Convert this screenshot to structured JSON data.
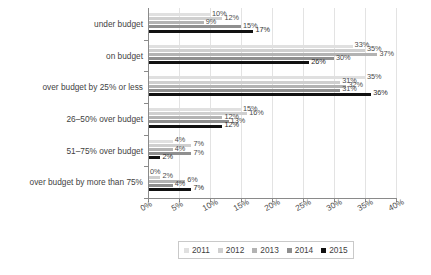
{
  "chart_data": {
    "type": "bar",
    "orientation": "horizontal",
    "title": "",
    "subtitle": "",
    "xlabel": "",
    "ylabel": "",
    "xlim": [
      0,
      40
    ],
    "grid": true,
    "legend_position": "bottom",
    "value_suffix": "%",
    "categories": [
      "under budget",
      "on budget",
      "over budget by 25% or less",
      "26–50% over budget",
      "51–75% over budget",
      "over budget by more than 75%"
    ],
    "xticks": [
      {
        "value": 0,
        "label": "0%"
      },
      {
        "value": 5,
        "label": "5%"
      },
      {
        "value": 10,
        "label": "10%"
      },
      {
        "value": 15,
        "label": "15%"
      },
      {
        "value": 20,
        "label": "20%"
      },
      {
        "value": 25,
        "label": "25%"
      },
      {
        "value": 30,
        "label": "30%"
      },
      {
        "value": 35,
        "label": "35%"
      },
      {
        "value": 40,
        "label": "40%"
      }
    ],
    "series": [
      {
        "name": "2011",
        "color": "#e0e0e0",
        "values": [
          10,
          33,
          35,
          15,
          4,
          0
        ],
        "labels": [
          "10%",
          "33%",
          "35%",
          "15%",
          "4%",
          "0%"
        ]
      },
      {
        "name": "2012",
        "color": "#cfcfcf",
        "values": [
          12,
          35,
          31,
          16,
          7,
          2
        ],
        "labels": [
          "12%",
          "35%",
          "31%",
          "16%",
          "7%",
          "2%"
        ]
      },
      {
        "name": "2013",
        "color": "#b3b3b3",
        "values": [
          9,
          37,
          32,
          12,
          4,
          6
        ],
        "labels": [
          "9%",
          "37%",
          "32%",
          "12%",
          "4%",
          "6%"
        ]
      },
      {
        "name": "2014",
        "color": "#8f8f8f",
        "values": [
          15,
          30,
          31,
          13,
          7,
          4
        ],
        "labels": [
          "15%",
          "30%",
          "31%",
          "13%",
          "7%",
          "4%"
        ]
      },
      {
        "name": "2015",
        "color": "#111111",
        "values": [
          17,
          26,
          36,
          12,
          2,
          7
        ],
        "labels": [
          "17%",
          "26%",
          "36%",
          "12%",
          "2%",
          "7%"
        ]
      }
    ]
  }
}
